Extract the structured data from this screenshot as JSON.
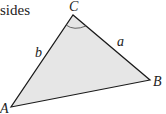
{
  "text_fragment": "sides",
  "triangle": {
    "fill": "#e6e6e6",
    "stroke": "#1a1a1a",
    "vertices": {
      "A": {
        "label": "A",
        "x": 11,
        "y": 107
      },
      "B": {
        "label": "B",
        "x": 150,
        "y": 80
      },
      "C": {
        "label": "C",
        "x": 73,
        "y": 15
      }
    },
    "sides": {
      "a": {
        "label": "a"
      },
      "b": {
        "label": "b"
      }
    },
    "angle_mark": "C"
  }
}
